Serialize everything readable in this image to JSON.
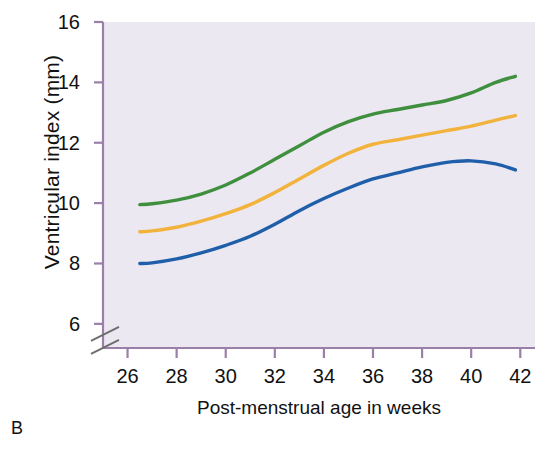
{
  "panel": {
    "label": "B"
  },
  "colors": {
    "plot_background": "#ece8f1",
    "axis_line": "#9c7fa8",
    "upper_curve": "#3f8f3f",
    "middle_curve": "#f2b33d",
    "lower_curve": "#1f5fa9",
    "text": "#111111",
    "page_background": "#ffffff"
  },
  "chart_data": {
    "type": "line",
    "title": "",
    "subtitle": "",
    "xlabel": "Post-menstrual age in weeks",
    "ylabel": "Ventricular index (mm)",
    "xlim": [
      25.0,
      42.6
    ],
    "ylim": [
      5.2,
      16.0
    ],
    "y_axis_break": {
      "present": true,
      "between": [
        6,
        8
      ],
      "label": "axis-break"
    },
    "grid": false,
    "legend": "none",
    "xticks": [
      26,
      28,
      30,
      32,
      34,
      36,
      38,
      40,
      42
    ],
    "xtick_labels": [
      "26",
      "28",
      "30",
      "32",
      "34",
      "36",
      "38",
      "40",
      "42"
    ],
    "yticks": [
      6,
      8,
      10,
      12,
      14,
      16
    ],
    "ytick_labels": [
      "6",
      "8",
      "10",
      "12",
      "14",
      "16"
    ],
    "x": [
      26.5,
      27,
      28,
      29,
      30,
      31,
      32,
      33,
      34,
      35,
      36,
      37,
      38,
      39,
      40,
      41,
      41.8
    ],
    "series": [
      {
        "name": "upper-centile",
        "color": "#3f8f3f",
        "values": [
          9.95,
          9.98,
          10.1,
          10.3,
          10.6,
          11.0,
          11.45,
          11.9,
          12.35,
          12.7,
          12.95,
          13.1,
          13.25,
          13.4,
          13.65,
          14.0,
          14.2
        ]
      },
      {
        "name": "median-centile",
        "color": "#f2b33d",
        "values": [
          9.05,
          9.08,
          9.2,
          9.4,
          9.65,
          9.95,
          10.35,
          10.8,
          11.25,
          11.65,
          11.95,
          12.1,
          12.25,
          12.4,
          12.55,
          12.75,
          12.9
        ]
      },
      {
        "name": "lower-centile",
        "color": "#1f5fa9",
        "values": [
          8.0,
          8.02,
          8.15,
          8.35,
          8.6,
          8.9,
          9.3,
          9.75,
          10.15,
          10.5,
          10.8,
          11.0,
          11.2,
          11.35,
          11.4,
          11.3,
          11.1
        ]
      }
    ]
  }
}
